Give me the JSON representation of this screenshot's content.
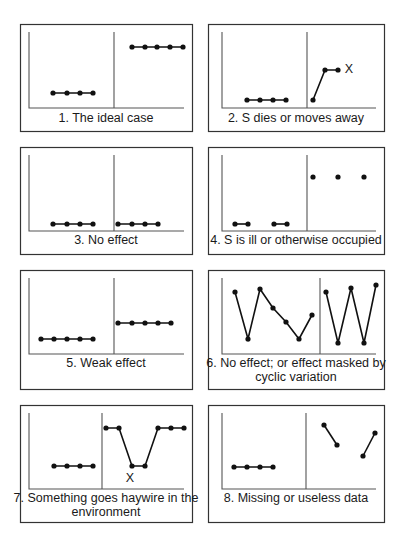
{
  "chart_data": [
    {
      "type": "line",
      "panel": 1,
      "title": "1. The ideal case",
      "caption_lines": [
        "1. The ideal case"
      ],
      "box": [
        20,
        24,
        192,
        131
      ],
      "axis": {
        "x0": 29,
        "yTop": 32,
        "yBase": 108,
        "x1": 184,
        "divider": 114
      },
      "segments": [
        {
          "points": [
            [
              53,
              93
            ],
            [
              67,
              93
            ],
            [
              80,
              93
            ],
            [
              93,
              93
            ]
          ],
          "connected": true
        },
        {
          "points": [
            [
              132,
              47
            ],
            [
              145,
              47
            ],
            [
              157,
              47
            ],
            [
              170,
              47
            ],
            [
              183,
              47
            ]
          ],
          "connected": true
        }
      ],
      "marks": [],
      "caption_y": [
        122
      ]
    },
    {
      "type": "line",
      "panel": 2,
      "title": "2. S dies or moves away",
      "caption_lines": [
        "2. S dies or moves away"
      ],
      "box": [
        208,
        24,
        384,
        131
      ],
      "axis": {
        "x0": 222,
        "yTop": 32,
        "yBase": 108,
        "x1": 376,
        "divider": 307
      },
      "segments": [
        {
          "points": [
            [
              247,
              100
            ],
            [
              260,
              100
            ],
            [
              273,
              100
            ],
            [
              286,
              100
            ]
          ],
          "connected": true
        },
        {
          "points": [
            [
              313,
              100
            ],
            [
              325,
              70
            ],
            [
              338,
              70
            ]
          ],
          "connected": true
        }
      ],
      "marks": [
        {
          "label": "X",
          "x": 349,
          "y": 73
        }
      ],
      "caption_y": [
        122
      ]
    },
    {
      "type": "line",
      "panel": 3,
      "title": "3. No effect",
      "caption_lines": [
        "3. No effect"
      ],
      "box": [
        20,
        147,
        192,
        254
      ],
      "axis": {
        "x0": 29,
        "yTop": 155,
        "yBase": 231,
        "x1": 184,
        "divider": 114
      },
      "segments": [
        {
          "points": [
            [
              53,
              224
            ],
            [
              67,
              224
            ],
            [
              80,
              224
            ],
            [
              93,
              224
            ]
          ],
          "connected": true
        },
        {
          "points": [
            [
              118,
              224
            ],
            [
              132,
              224
            ],
            [
              145,
              224
            ],
            [
              158,
              224
            ]
          ],
          "connected": true
        }
      ],
      "marks": [],
      "caption_y": [
        244
      ]
    },
    {
      "type": "line",
      "panel": 4,
      "title": "4. S is ill or otherwise occupied",
      "caption_lines": [
        "4. S is ill or otherwise occupied"
      ],
      "box": [
        208,
        147,
        384,
        254
      ],
      "axis": {
        "x0": 222,
        "yTop": 155,
        "yBase": 231,
        "x1": 376,
        "divider": 307
      },
      "segments": [
        {
          "points": [
            [
              235,
              224
            ],
            [
              248,
              224
            ]
          ],
          "connected": true
        },
        {
          "points": [
            [
              274,
              224
            ],
            [
              287,
              224
            ]
          ],
          "connected": true
        },
        {
          "points": [
            [
              313,
              177
            ]
          ],
          "connected": false
        },
        {
          "points": [
            [
              338,
              177
            ]
          ],
          "connected": false
        },
        {
          "points": [
            [
              364,
              177
            ]
          ],
          "connected": false
        }
      ],
      "marks": [],
      "caption_y": [
        244
      ]
    },
    {
      "type": "line",
      "panel": 5,
      "title": "5. Weak effect",
      "caption_lines": [
        "5. Weak effect"
      ],
      "box": [
        20,
        270,
        192,
        389
      ],
      "axis": {
        "x0": 29,
        "yTop": 278,
        "yBase": 354,
        "x1": 184,
        "divider": 114
      },
      "segments": [
        {
          "points": [
            [
              41,
              339
            ],
            [
              54,
              339
            ],
            [
              67,
              339
            ],
            [
              80,
              339
            ],
            [
              93,
              339
            ]
          ],
          "connected": true
        },
        {
          "points": [
            [
              118,
              323
            ],
            [
              132,
              323
            ],
            [
              145,
              323
            ],
            [
              158,
              323
            ],
            [
              171,
              323
            ]
          ],
          "connected": true
        }
      ],
      "marks": [],
      "caption_y": [
        367
      ]
    },
    {
      "type": "line",
      "panel": 6,
      "title": "6. No effect; or effect masked by cyclic variation",
      "caption_lines": [
        "6. No effect; or effect masked by",
        "cyclic variation"
      ],
      "box": [
        208,
        270,
        384,
        389
      ],
      "axis": {
        "x0": 222,
        "yTop": 278,
        "yBase": 354,
        "x1": 376,
        "divider": 320
      },
      "segments": [
        {
          "points": [
            [
              235,
              292
            ],
            [
              248,
              339
            ],
            [
              260,
              289
            ],
            [
              273,
              308
            ],
            [
              286,
              322
            ],
            [
              299,
              339
            ],
            [
              312,
              315
            ]
          ],
          "connected": true
        },
        {
          "points": [
            [
              326,
              292
            ],
            [
              338,
              343
            ],
            [
              351,
              288
            ],
            [
              364,
              343
            ],
            [
              376,
              285
            ]
          ],
          "connected": true
        }
      ],
      "marks": [],
      "caption_y": [
        367,
        381
      ]
    },
    {
      "type": "line",
      "panel": 7,
      "title": "7. Something goes haywire in the environment",
      "caption_lines": [
        "7. Something goes haywire in the",
        "environment"
      ],
      "box": [
        20,
        405,
        192,
        522
      ],
      "axis": {
        "x0": 29,
        "yTop": 413,
        "yBase": 489,
        "x1": 184,
        "divider": 102
      },
      "segments": [
        {
          "points": [
            [
              54,
              466
            ],
            [
              67,
              466
            ],
            [
              80,
              466
            ],
            [
              93,
              466
            ]
          ],
          "connected": true
        },
        {
          "points": [
            [
              106,
              428
            ],
            [
              119,
              428
            ],
            [
              132,
              466
            ],
            [
              145,
              466
            ],
            [
              158,
              428
            ],
            [
              171,
              428
            ],
            [
              184,
              428
            ]
          ],
          "connected": true
        }
      ],
      "marks": [
        {
          "label": "X",
          "x": 130,
          "y": 482
        }
      ],
      "caption_y": [
        502,
        516
      ]
    },
    {
      "type": "line",
      "panel": 8,
      "title": "8. Missing or useless data",
      "caption_lines": [
        "8. Missing or useless data"
      ],
      "box": [
        208,
        405,
        384,
        522
      ],
      "axis": {
        "x0": 222,
        "yTop": 413,
        "yBase": 489,
        "x1": 376,
        "divider": 306
      },
      "segments": [
        {
          "points": [
            [
              234,
              467
            ],
            [
              247,
              467
            ],
            [
              260,
              467
            ],
            [
              273,
              467
            ]
          ],
          "connected": true
        },
        {
          "points": [
            [
              324,
              425
            ],
            [
              337,
              445
            ]
          ],
          "connected": true
        },
        {
          "points": [
            [
              363,
              456
            ],
            [
              375,
              433
            ]
          ],
          "connected": true
        }
      ],
      "marks": [],
      "caption_y": [
        502
      ]
    }
  ],
  "style": {
    "point_color": "#111111",
    "line_color": "#111111",
    "axis_color": "#555555",
    "box_color": "#333333"
  }
}
